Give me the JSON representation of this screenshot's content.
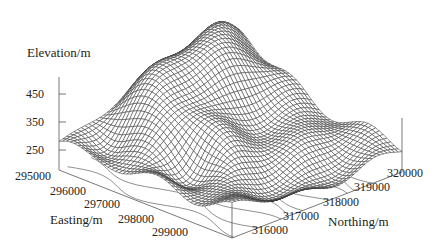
{
  "chart_data": {
    "type": "surface3d",
    "title": "",
    "zlabel": "Elevation/m",
    "xlabel": "Easting/m",
    "ylabel": "Northing/m",
    "z_ticks": [
      "450",
      "350",
      "250"
    ],
    "x_ticks": [
      "295000",
      "296000",
      "297000",
      "298000",
      "299000"
    ],
    "y_ticks": [
      "316000",
      "317000",
      "318000",
      "319000",
      "320000"
    ],
    "x_range": [
      295000,
      300000
    ],
    "y_range": [
      315500,
      320000
    ],
    "z_range": [
      200,
      500
    ],
    "style": "wireframe mesh with contour projection on base",
    "colors": {
      "mesh": "#333333",
      "axis": "#666666",
      "contour": "#333333",
      "background": "#ffffff"
    }
  }
}
